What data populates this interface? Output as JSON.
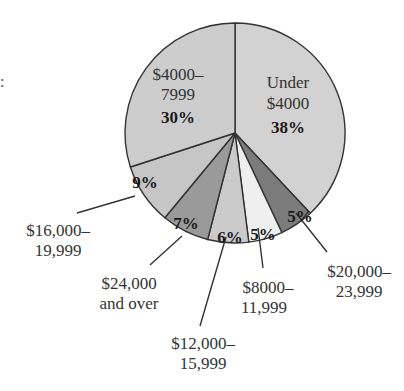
{
  "chart_data": {
    "type": "pie",
    "title": "",
    "start_angle_deg": 0,
    "direction": "clockwise",
    "slices": [
      {
        "label": "Under $4000",
        "label_lines": [
          "Under",
          "$4000"
        ],
        "value": 38,
        "display": "38%",
        "color": "#d2d2d2"
      },
      {
        "label": "$20,000–23,999",
        "label_lines": [
          "$20,000–",
          "23,999"
        ],
        "value": 5,
        "display": "5%",
        "color": "#7c7c7c"
      },
      {
        "label": "$8000–11,999",
        "label_lines": [
          "$8000–",
          "11,999"
        ],
        "value": 5,
        "display": "5%",
        "color": "#efefef"
      },
      {
        "label": "$12,000–15,999",
        "label_lines": [
          "$12,000–",
          "15,999"
        ],
        "value": 6,
        "display": "6%",
        "color": "#cbcbcb"
      },
      {
        "label": "$24,000 and over",
        "label_lines": [
          "$24,000",
          "and over"
        ],
        "value": 7,
        "display": "7%",
        "color": "#9a9a9a"
      },
      {
        "label": "$16,000–19,999",
        "label_lines": [
          "$16,000–",
          "19,999"
        ],
        "value": 9,
        "display": "9%",
        "color": "#c6c6c6"
      },
      {
        "label": "$4000–7999",
        "label_lines": [
          "$4000–",
          "7999"
        ],
        "value": 30,
        "display": "30%",
        "color": "#cdcdcd"
      }
    ],
    "legend": "none",
    "annotations": [
      "leader lines to external labels for small slices"
    ]
  },
  "stray_text": ":"
}
